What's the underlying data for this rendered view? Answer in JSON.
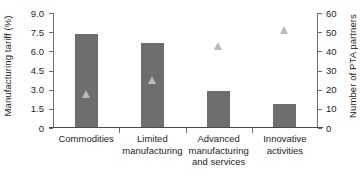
{
  "chart_data": {
    "type": "bar",
    "title": "",
    "subtitle": "",
    "xlabel": "",
    "categories": [
      "Commodities",
      "Limited manufacturing",
      "Advanced manufacturing and services",
      "Innovative activities"
    ],
    "category_lines": [
      [
        "Commodities"
      ],
      [
        "Limited",
        "manufacturing"
      ],
      [
        "Advanced",
        "manufacturing",
        "and services"
      ],
      [
        "Innovative",
        "activities"
      ]
    ],
    "grid": false,
    "legend": "none",
    "series": [
      {
        "name": "Manufacturing tariff (%)",
        "type": "bar",
        "axis": "left",
        "color": "#6e6e6e",
        "values": [
          7.3,
          6.6,
          2.85,
          1.8
        ]
      },
      {
        "name": "Number of PTA partners",
        "type": "scatter",
        "marker": "triangle",
        "axis": "right",
        "color": "#b9b9b9",
        "values": [
          18,
          25,
          43,
          51
        ]
      }
    ],
    "left_axis": {
      "label": "Manufacturing tariff (%)",
      "ylim": [
        0,
        9
      ],
      "ticks": [
        0,
        1.5,
        3.0,
        4.5,
        6.0,
        7.5,
        9.0
      ],
      "tick_labels": [
        "0",
        "1.5",
        "3.0",
        "4.5",
        "6.0",
        "7.5",
        "9.0"
      ]
    },
    "right_axis": {
      "label": "Number of PTA partners",
      "ylim": [
        0,
        60
      ],
      "ticks": [
        0,
        10,
        20,
        30,
        40,
        50,
        60
      ],
      "tick_labels": [
        "0",
        "10",
        "20",
        "30",
        "40",
        "50",
        "60"
      ]
    }
  }
}
